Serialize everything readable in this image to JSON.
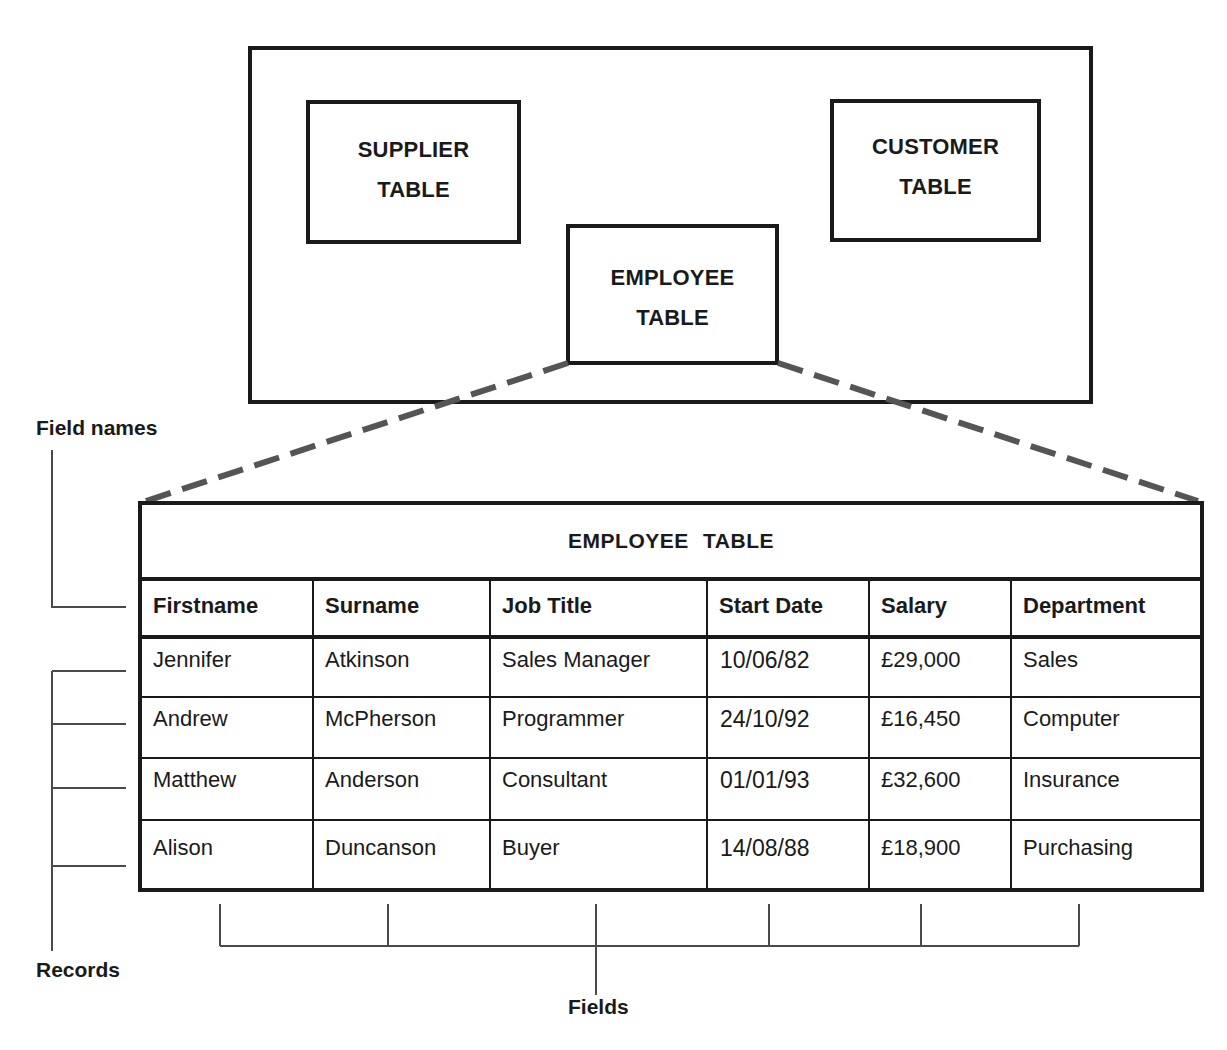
{
  "database": {
    "tables": [
      {
        "id": "supplier",
        "line1": "SUPPLIER",
        "line2": "TABLE"
      },
      {
        "id": "customer",
        "line1": "CUSTOMER",
        "line2": "TABLE"
      },
      {
        "id": "employee",
        "line1": "EMPLOYEE",
        "line2": "TABLE"
      }
    ]
  },
  "employee_table": {
    "title": "EMPLOYEE TABLE",
    "columns": [
      "Firstname",
      "Surname",
      "Job Title",
      "Start Date",
      "Salary",
      "Department"
    ],
    "rows": [
      [
        "Jennifer",
        "Atkinson",
        "Sales Manager",
        "10/06/82",
        "£29,000",
        "Sales"
      ],
      [
        "Andrew",
        "McPherson",
        "Programmer",
        "24/10/92",
        "£16,450",
        "Computer"
      ],
      [
        "Matthew",
        "Anderson",
        "Consultant",
        "01/01/93",
        "£32,600",
        "Insurance"
      ],
      [
        "Alison",
        "Duncanson",
        "Buyer",
        "14/08/88",
        "£18,900",
        "Purchasing"
      ]
    ]
  },
  "annotations": {
    "field_names": "Field names",
    "records": "Records",
    "fields": "Fields"
  },
  "colors": {
    "line": "#1a1a1a",
    "dashed_connector": "#555555",
    "bracket": "#4a4a4a"
  }
}
